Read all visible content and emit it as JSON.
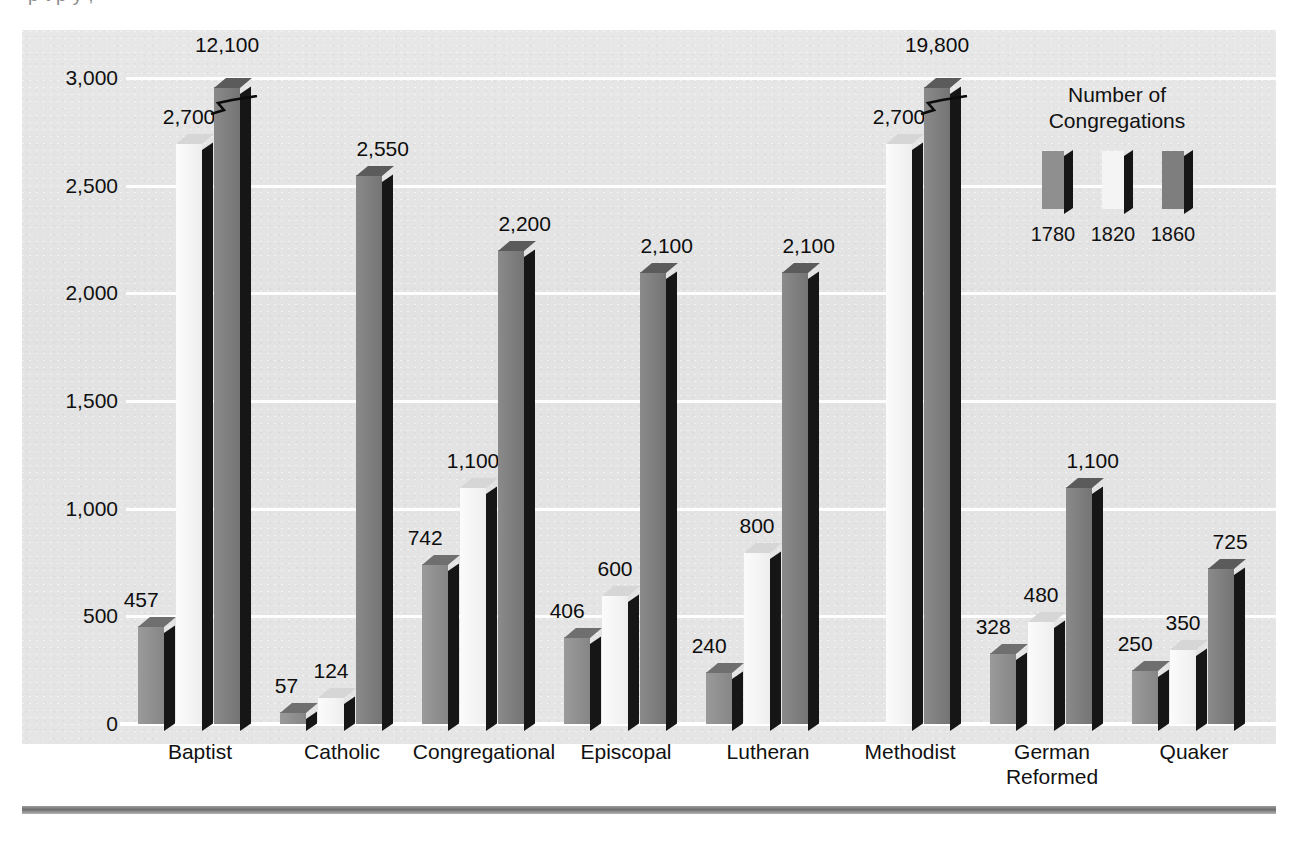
{
  "page": {
    "top_caption_ghost": "p        t       p    y                    ,",
    "bottom_rule": "horizontal-rule"
  },
  "legend": {
    "title_line1": "Number of",
    "title_line2": "Congregations",
    "keys": [
      {
        "label": "1780",
        "color": "#8f8f8f"
      },
      {
        "label": "1820",
        "color": "#f4f4f4"
      },
      {
        "label": "1860",
        "color": "#7e7e7e"
      }
    ]
  },
  "chart_data": {
    "type": "bar",
    "title": "Number of Congregations",
    "xlabel": "",
    "ylabel": "",
    "ylim": [
      0,
      3000
    ],
    "yticks": [
      "0",
      "500",
      "1,000",
      "1,500",
      "2,000",
      "2,500",
      "3,000"
    ],
    "ytick_values": [
      0,
      500,
      1000,
      1500,
      2000,
      2500,
      3000
    ],
    "grid": true,
    "legend_position": "top-right",
    "categories": [
      "Baptist",
      "Catholic",
      "Congregational",
      "Episcopal",
      "Lutheran",
      "Methodist",
      "German\nReformed",
      "Quaker"
    ],
    "series": [
      {
        "name": "1780",
        "values": [
          457,
          57,
          742,
          406,
          240,
          null,
          328,
          250
        ],
        "labels": [
          "457",
          "57",
          "742",
          "406",
          "240",
          "",
          "328",
          "250"
        ]
      },
      {
        "name": "1820",
        "values": [
          2700,
          124,
          1100,
          600,
          800,
          2700,
          480,
          350
        ],
        "labels": [
          "2,700",
          "124",
          "1,100",
          "600",
          "800",
          "2,700",
          "480",
          "350"
        ]
      },
      {
        "name": "1860",
        "values": [
          12100,
          2550,
          2200,
          2100,
          2100,
          19800,
          1100,
          725
        ],
        "labels": [
          "12,100",
          "2,550",
          "2,200",
          "2,100",
          "2,100",
          "19,800",
          "1,100",
          "725"
        ],
        "truncated": [
          true,
          false,
          false,
          false,
          false,
          true,
          false,
          false
        ]
      }
    ]
  }
}
